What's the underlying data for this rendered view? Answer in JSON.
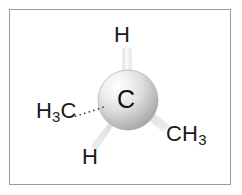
{
  "figure": {
    "kind": "molecular-structure-diagram",
    "frame": {
      "border_color": "#9a9a9a",
      "background_color": "#ffffff"
    }
  },
  "central_atom": {
    "element_label": "C",
    "sphere": {
      "center_x": 128,
      "center_y": 100,
      "radius": 30,
      "highlight_color": "#fdfdfd",
      "mid_color": "#e2e2e2",
      "shade_color": "#a8a8a8",
      "edge_color": "#9b9b9b"
    }
  },
  "substituents": [
    {
      "id": "h-top",
      "label_text": "H",
      "subscript": "",
      "bond_type": "plain",
      "direction": "up",
      "bond_color": "#ededed"
    },
    {
      "id": "h3c-left",
      "label_text": "H",
      "subscript": "3",
      "label_tail": "C",
      "bond_type": "hashed",
      "direction": "left-back",
      "bond_color": "#4a4a4a"
    },
    {
      "id": "h-bottom-left",
      "label_text": "H",
      "subscript": "",
      "bond_type": "wedge",
      "direction": "down-left-front",
      "bond_color": "#e4e4e4"
    },
    {
      "id": "ch3-right",
      "label_text": "CH",
      "subscript": "3",
      "bond_type": "wedge",
      "direction": "down-right-front",
      "bond_color": "#e4e4e4"
    }
  ],
  "labels": {
    "h_top": "H",
    "h3c_left_main": "H",
    "h3c_left_sub": "3",
    "h3c_left_tail": "C",
    "h_bottom": "H",
    "ch3_right_main": "CH",
    "ch3_right_sub": "3",
    "center": "C"
  }
}
